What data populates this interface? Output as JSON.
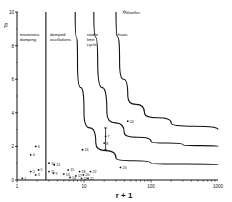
{
  "chart_data": {
    "type": "scatter",
    "title": "",
    "xlabel": "r + 1",
    "ylabel": "β",
    "xscale": "log",
    "xlim": [
      1,
      1000
    ],
    "ylim": [
      0,
      10
    ],
    "x_ticks": [
      1,
      10,
      100,
      1000
    ],
    "x_tick_labels": [
      "1",
      "10",
      "100",
      "1000"
    ],
    "y_ticks": [
      0,
      2,
      4,
      6,
      8,
      10
    ],
    "y_tick_labels": [
      "0",
      "2",
      "4",
      "6",
      "8",
      "10"
    ],
    "grid": false,
    "region_labels": [
      {
        "text": [
          "monotonic",
          "damping"
        ],
        "x": 1.1,
        "y": 8.6
      },
      {
        "text": [
          "damped",
          "oscillations"
        ],
        "x": 3.1,
        "y": 8.6
      },
      {
        "text": [
          "stable",
          "limit",
          "cycle"
        ],
        "x": 11.0,
        "y": 8.6
      },
      {
        "text": [
          "chaos"
        ],
        "x": 30.0,
        "y": 8.6
      }
    ],
    "boundaries": [
      {
        "name": "monotonic/damped",
        "points": [
          [
            2.7,
            10
          ],
          [
            2.7,
            0
          ]
        ]
      },
      {
        "name": "damped/limit-cycle",
        "points": [
          [
            7.4,
            10
          ],
          [
            8,
            7
          ],
          [
            10,
            4
          ],
          [
            15,
            2.2
          ],
          [
            30,
            1.3
          ],
          [
            100,
            1.0
          ],
          [
            1000,
            0.9
          ]
        ]
      },
      {
        "name": "limit-cycle/chaos",
        "points": [
          [
            14,
            10
          ],
          [
            16,
            7
          ],
          [
            22,
            4
          ],
          [
            40,
            2.8
          ],
          [
            100,
            2.3
          ],
          [
            300,
            2.1
          ],
          [
            1000,
            2.0
          ]
        ]
      },
      {
        "name": "chaos/upper",
        "points": [
          [
            30,
            10
          ],
          [
            34,
            7
          ],
          [
            45,
            5
          ],
          [
            80,
            4
          ],
          [
            200,
            3.4
          ],
          [
            1000,
            3.0
          ]
        ]
      }
    ],
    "points": [
      {
        "label": "blowflies",
        "x": 40,
        "y": 10,
        "marker": "open"
      },
      {
        "label": "24",
        "x": 45,
        "y": 3.5
      },
      {
        "label": "7",
        "x": 21,
        "y": 2.6
      },
      {
        "label": "8",
        "x": 20,
        "y": 2.2
      },
      {
        "label": "23",
        "x": 35,
        "y": 0.75
      },
      {
        "label": "6",
        "x": 1.9,
        "y": 2.0
      },
      {
        "label": "4",
        "x": 1.6,
        "y": 1.5
      },
      {
        "label": "16",
        "x": 9.5,
        "y": 1.8
      },
      {
        "label": "10",
        "x": 3.0,
        "y": 1.0
      },
      {
        "label": "12",
        "x": 3.6,
        "y": 0.9
      },
      {
        "label": "5",
        "x": 2.1,
        "y": 0.6
      },
      {
        "label": "2",
        "x": 1.6,
        "y": 0.5
      },
      {
        "label": "3",
        "x": 1.9,
        "y": 0.3
      },
      {
        "label": "1",
        "x": 1.2,
        "y": 0.1
      },
      {
        "label": "11",
        "x": 3.0,
        "y": 0.5
      },
      {
        "label": "9",
        "x": 3.5,
        "y": 0.4
      },
      {
        "label": "13",
        "x": 5.0,
        "y": 0.35
      },
      {
        "label": "15",
        "x": 5.8,
        "y": 0.6
      },
      {
        "label": "14",
        "x": 6.2,
        "y": 0.15
      },
      {
        "label": "17",
        "x": 7.6,
        "y": 0.25
      },
      {
        "label": "18",
        "x": 8.6,
        "y": 0.5
      },
      {
        "label": "19",
        "x": 9.2,
        "y": 0.1
      },
      {
        "label": "20",
        "x": 9.8,
        "y": 0.3
      },
      {
        "label": "21",
        "x": 11.5,
        "y": 0.1
      },
      {
        "label": "22",
        "x": 12.5,
        "y": 0.5
      }
    ]
  }
}
